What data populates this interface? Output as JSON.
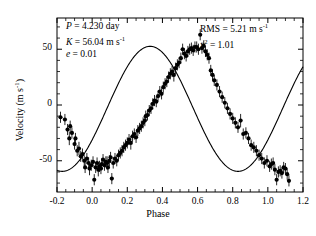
{
  "figure": {
    "axis_label_x": "Phase",
    "axis_label_y_pre": "Velocity (m s",
    "axis_label_y_sup": "-1",
    "axis_label_y_post": ")"
  },
  "annotations": {
    "period_symbol": "P",
    "period_text": " = 4.230 day",
    "amplitude_symbol": "K",
    "amplitude_text_pre": " = 56.04 m s",
    "amplitude_sup": "-1",
    "eccentricity_symbol": "e",
    "eccentricity_text": " = 0.01",
    "rms_text_pre": "RMS = 5.21 m s",
    "rms_sup": "-1",
    "chisq_symbol": "x",
    "chisq_sup": "2",
    "chisq_text": " = 1.01"
  },
  "chart_data": {
    "type": "scatter",
    "title": "",
    "xlabel": "Phase",
    "ylabel": "Velocity (m s^-1)",
    "xlim": [
      -0.2,
      1.2
    ],
    "ylim": [
      -78,
      78
    ],
    "xticks": [
      -0.2,
      0.0,
      0.2,
      0.4,
      0.6,
      0.8,
      1.0,
      1.2
    ],
    "xticklabels": [
      "-0.2",
      "0.0",
      "0.2",
      "0.4",
      "0.6",
      "0.8",
      "1.0",
      "1.2"
    ],
    "yticks": [
      -50,
      0,
      50
    ],
    "yticklabels": [
      "-50",
      "0",
      "50"
    ],
    "minor_ticks_per_interval_x": 2,
    "minor_tick_step_y": 10,
    "grid": false,
    "legend": null,
    "tick_direction": "in",
    "frame": "box",
    "model_curve": {
      "name": "Keplerian orbit fit",
      "period": 4.23,
      "semi_amplitude": 56.04,
      "eccentricity": 0.01,
      "phase_of_maximum": 0.58,
      "systemic_offset": -4.0,
      "color": "#000000"
    },
    "series": [
      {
        "name": "Radial velocity measurements",
        "marker": "filled-circle",
        "color": "#000000",
        "errorbars": "vertical",
        "x": [
          -0.18,
          -0.155,
          -0.14,
          -0.13,
          -0.125,
          -0.115,
          -0.1,
          -0.095,
          -0.085,
          -0.075,
          -0.065,
          -0.055,
          -0.045,
          -0.04,
          -0.03,
          -0.02,
          -0.015,
          -0.005,
          0.005,
          0.012,
          0.02,
          0.028,
          0.035,
          0.042,
          0.05,
          0.055,
          0.062,
          0.07,
          0.078,
          0.085,
          0.09,
          0.098,
          0.105,
          0.112,
          0.12,
          0.13,
          0.14,
          0.15,
          0.16,
          0.17,
          0.18,
          0.19,
          0.2,
          0.21,
          0.22,
          0.23,
          0.24,
          0.25,
          0.26,
          0.27,
          0.28,
          0.29,
          0.3,
          0.305,
          0.315,
          0.325,
          0.335,
          0.345,
          0.355,
          0.365,
          0.375,
          0.385,
          0.395,
          0.405,
          0.415,
          0.425,
          0.435,
          0.445,
          0.455,
          0.465,
          0.475,
          0.485,
          0.495,
          0.505,
          0.515,
          0.525,
          0.535,
          0.545,
          0.555,
          0.565,
          0.575,
          0.585,
          0.595,
          0.605,
          0.615,
          0.625,
          0.635,
          0.645,
          0.655,
          0.665,
          0.675,
          0.685,
          0.695,
          0.71,
          0.725,
          0.74,
          0.755,
          0.77,
          0.785,
          0.8,
          0.815,
          0.83,
          0.845,
          0.86,
          0.875,
          0.89,
          0.905,
          0.92,
          0.935,
          0.95,
          0.965,
          0.98,
          0.995,
          1.01,
          1.02,
          1.03,
          1.04,
          1.05,
          1.06,
          1.07,
          1.08,
          1.09,
          1.1,
          1.11,
          1.12
        ],
        "y": [
          -11,
          -13,
          -22,
          -30,
          -19,
          -25,
          -35,
          -30,
          -41,
          -39,
          -46,
          -44,
          -50,
          -56,
          -48,
          -52,
          -57,
          -54,
          -51,
          -67,
          -56,
          -52,
          -58,
          -55,
          -57,
          -53,
          -49,
          -54,
          -51,
          -52,
          -56,
          -50,
          -47,
          -66,
          -52,
          -48,
          -50,
          -45,
          -43,
          -41,
          -38,
          -36,
          -34,
          -31,
          -34,
          -28,
          -26,
          -29,
          -23,
          -21,
          -19,
          -16,
          -14,
          -10,
          -9,
          -5,
          -3,
          1,
          4,
          3,
          8,
          12,
          10,
          16,
          19,
          21,
          25,
          28,
          30,
          27,
          33,
          36,
          38,
          42,
          50,
          46,
          44,
          48,
          50,
          51,
          49,
          52,
          52,
          50,
          63,
          51,
          53,
          48,
          45,
          42,
          31,
          27,
          22,
          18,
          12,
          7,
          2,
          -3,
          -8,
          -12,
          -16,
          -20,
          -14,
          -26,
          -25,
          -30,
          -36,
          -38,
          -41,
          -45,
          -48,
          -52,
          -50,
          -55,
          -53,
          -52,
          -58,
          -67,
          -60,
          -59,
          -61,
          -56,
          -57,
          -62,
          -68
        ],
        "yerr": [
          5,
          5,
          5,
          6,
          5,
          5,
          5,
          5,
          5,
          6,
          5,
          5,
          5,
          5,
          5,
          5,
          6,
          5,
          5,
          5,
          5,
          5,
          6,
          5,
          5,
          5,
          5,
          5,
          5,
          6,
          5,
          5,
          5,
          5,
          5,
          5,
          5,
          5,
          5,
          5,
          5,
          5,
          5,
          5,
          6,
          5,
          5,
          5,
          5,
          5,
          5,
          5,
          5,
          5,
          5,
          5,
          5,
          5,
          5,
          5,
          5,
          5,
          5,
          5,
          5,
          5,
          5,
          5,
          5,
          6,
          5,
          5,
          5,
          5,
          5,
          5,
          5,
          5,
          5,
          5,
          5,
          5,
          5,
          5,
          5,
          5,
          5,
          5,
          5,
          5,
          5,
          5,
          5,
          5,
          5,
          5,
          5,
          5,
          5,
          5,
          5,
          5,
          6,
          5,
          5,
          5,
          5,
          5,
          5,
          5,
          5,
          5,
          5,
          5,
          5,
          5,
          5,
          5,
          5,
          5,
          5,
          5,
          5,
          5,
          5
        ]
      }
    ]
  }
}
